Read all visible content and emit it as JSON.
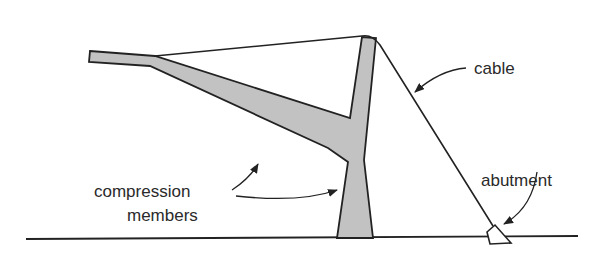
{
  "diagram": {
    "type": "structural-schematic",
    "labels": {
      "compression_line1": "compression",
      "compression_line2": "members",
      "cable": "cable",
      "abutment": "abutment"
    },
    "colors": {
      "member_fill": "#c2c2c2",
      "stroke": "#222222",
      "background": "#ffffff"
    }
  }
}
